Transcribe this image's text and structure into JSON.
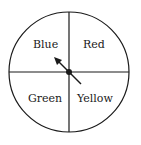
{
  "spinner": {
    "sections": [
      {
        "label": "Blue"
      },
      {
        "label": "Red"
      },
      {
        "label": "Green"
      },
      {
        "label": "Yellow"
      }
    ],
    "pointer_direction": "toward Blue"
  }
}
